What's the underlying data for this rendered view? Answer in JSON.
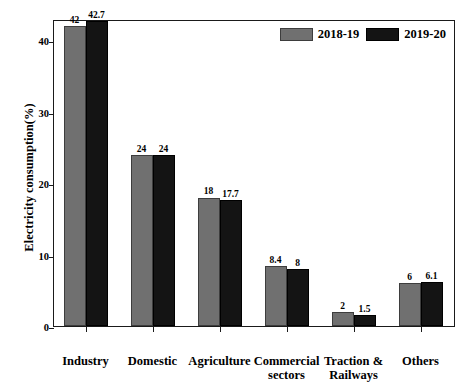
{
  "chart_data": {
    "type": "bar",
    "title": "",
    "subtitle": "",
    "xlabel": "",
    "ylabel": "Electricity consumption(%)",
    "ylim": [
      0,
      43
    ],
    "yticks": [
      0,
      10,
      20,
      30,
      40
    ],
    "ytick_labels": [
      "0",
      "10",
      "20",
      "30",
      "40"
    ],
    "grid": false,
    "legend_position": "top-right",
    "categories": [
      "Industry",
      "Domestic",
      "Agriculture",
      "Commercial sectors",
      "Traction & Railways",
      "Others"
    ],
    "category_lines": [
      [
        "Industry"
      ],
      [
        "Domestic"
      ],
      [
        "Agriculture"
      ],
      [
        "Commercial",
        "sectors"
      ],
      [
        "Traction &",
        "Railways"
      ],
      [
        "Others"
      ]
    ],
    "series": [
      {
        "name": "2018-19",
        "color": "#707070",
        "values": [
          42,
          24,
          18,
          8.4,
          2,
          6
        ],
        "value_labels": [
          "42",
          "24",
          "18",
          "8.4",
          "2",
          "6"
        ]
      },
      {
        "name": "2019-20",
        "color": "#141414",
        "values": [
          42.7,
          24,
          17.7,
          8,
          1.5,
          6.1
        ],
        "value_labels": [
          "42.7",
          "24",
          "17.7",
          "8",
          "1.5",
          "6.1"
        ]
      }
    ]
  },
  "legend": {
    "items": [
      {
        "label": "2018-19",
        "swatch": "gray"
      },
      {
        "label": "2019-20",
        "swatch": "black"
      }
    ]
  }
}
